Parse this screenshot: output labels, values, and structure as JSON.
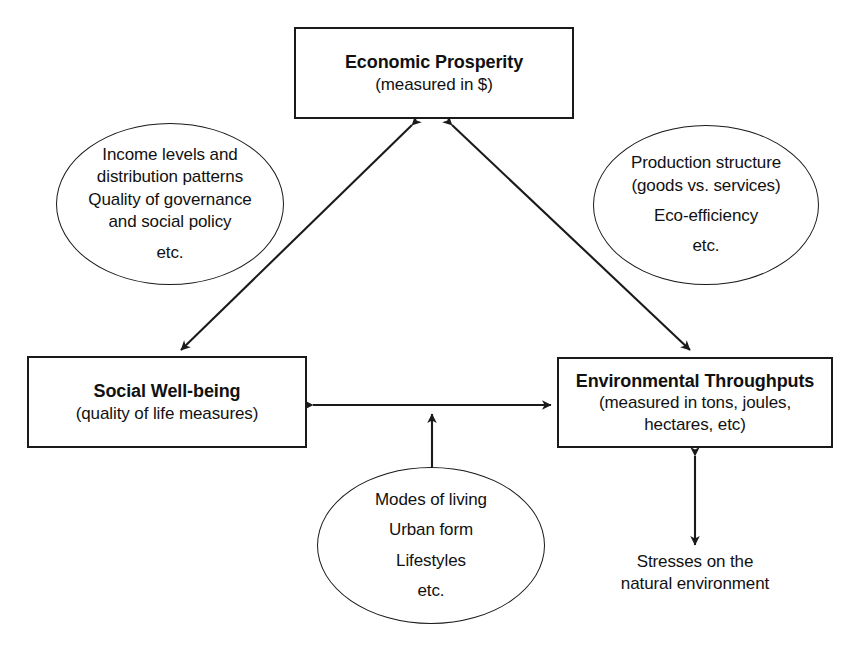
{
  "diagram": {
    "stroke_color": "#1a1a1a",
    "background_color": "#ffffff"
  },
  "nodes": {
    "economic": {
      "title": "Economic Prosperity",
      "subtitle_lines": [
        "(measured in $)"
      ]
    },
    "social": {
      "title": "Social Well-being",
      "subtitle_lines": [
        "(quality of life measures)"
      ]
    },
    "environment": {
      "title": "Environmental Throughputs",
      "subtitle_lines": [
        "(measured in tons, joules,",
        "hectares, etc)"
      ]
    }
  },
  "ellipses": {
    "income": {
      "lines": [
        "Income levels and",
        "distribution patterns",
        "Quality of governance",
        "and social policy"
      ],
      "footer": "etc."
    },
    "production": {
      "lines": [
        "Production structure",
        "(goods vs. services)",
        "Eco-efficiency"
      ],
      "footer": "etc."
    },
    "modes": {
      "lines": [
        "Modes of living",
        "Urban form",
        "Lifestyles"
      ],
      "footer": "etc."
    }
  },
  "captions": {
    "stresses": {
      "lines": [
        "Stresses on the",
        "natural environment"
      ]
    }
  },
  "connections": [
    {
      "name": "economic-social",
      "from": "Economic Prosperity",
      "to": "Social Well-being",
      "style": "double-headed-arrow"
    },
    {
      "name": "economic-environment",
      "from": "Economic Prosperity",
      "to": "Environmental Throughputs",
      "style": "double-headed-arrow"
    },
    {
      "name": "social-environment",
      "from": "Social Well-being",
      "to": "Environmental Throughputs",
      "style": "double-headed-arrow"
    },
    {
      "name": "modes-to-social-environment-link",
      "from": "Modes of living / Urban form / Lifestyles",
      "to": "Social Well-being ↔ Environmental Throughputs link",
      "style": "single-headed-arrow"
    },
    {
      "name": "environment-stresses",
      "from": "Environmental Throughputs",
      "to": "Stresses on the natural environment",
      "style": "double-headed-arrow"
    }
  ]
}
